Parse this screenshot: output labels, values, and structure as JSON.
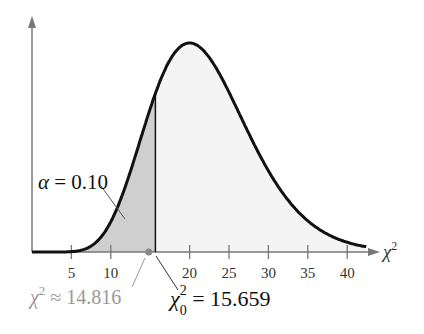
{
  "chart_data": {
    "type": "area",
    "title": "",
    "xlabel": "χ²",
    "ylabel": "",
    "distribution": "chi-square",
    "degrees_of_freedom": 22,
    "x_ticks": [
      5,
      10,
      20,
      25,
      30,
      35,
      40
    ],
    "xlim": [
      0,
      43
    ],
    "grid": false,
    "shaded_region": {
      "from": 0,
      "to": 15.659,
      "label": "α = 0.10"
    },
    "annotations": [
      {
        "label": "χ²₀ = 15.659",
        "x": 15.659
      },
      {
        "label": "χ² ≈ 14.816",
        "x": 14.816
      }
    ]
  },
  "labels": {
    "alpha": "α = 0.10",
    "axis": "χ",
    "axis_sup": "2",
    "critical_chi": "χ",
    "critical_sup": "2",
    "critical_sub": "0",
    "critical_value": " = 15.659",
    "test_chi": "χ",
    "test_sup": "2",
    "test_value": " ≈ 14.816"
  },
  "ticks": [
    "5",
    "10",
    "20",
    "25",
    "30",
    "35",
    "40"
  ]
}
